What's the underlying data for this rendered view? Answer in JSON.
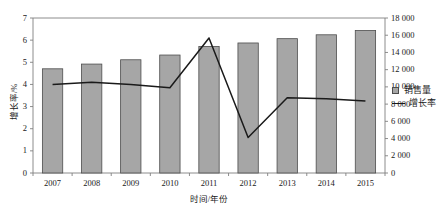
{
  "chart_data": {
    "type": "bar",
    "title": "",
    "xlabel": "时间/年份",
    "ylabel": "增长率/%",
    "y2label": "",
    "categories": [
      "2007",
      "2008",
      "2009",
      "2010",
      "2011",
      "2012",
      "2013",
      "2014",
      "2015"
    ],
    "ylim": [
      0,
      7
    ],
    "y2lim": [
      0,
      18000
    ],
    "yticks": [
      "0",
      "1",
      "2",
      "3",
      "4",
      "5",
      "6",
      "7"
    ],
    "y2ticks": [
      "0",
      "2 000",
      "4 000",
      "6 000",
      "8 000",
      "10 000",
      "12 000",
      "14 000",
      "16 000",
      "18 000"
    ],
    "grid": false,
    "legend_position": "right",
    "series": [
      {
        "name": "销售量",
        "type": "bar",
        "axis": "y2",
        "values": [
          12100,
          12650,
          13150,
          13700,
          14700,
          15100,
          15600,
          16050,
          16550
        ]
      },
      {
        "name": "增长率",
        "type": "line",
        "axis": "y",
        "values": [
          4.0,
          4.1,
          4.0,
          3.85,
          6.1,
          1.6,
          3.4,
          3.35,
          3.25
        ]
      }
    ]
  },
  "colors": {
    "bar_fill": "#a6a6a6",
    "bar_stroke": "#4d4d4d",
    "line": "#1a1a1a",
    "axis": "#808080",
    "text": "#1a1a1a"
  },
  "legend": {
    "items": [
      {
        "label": "销售量",
        "marker": "square-swatch-icon"
      },
      {
        "label": "增长率",
        "marker": "line-swatch-icon"
      }
    ]
  }
}
